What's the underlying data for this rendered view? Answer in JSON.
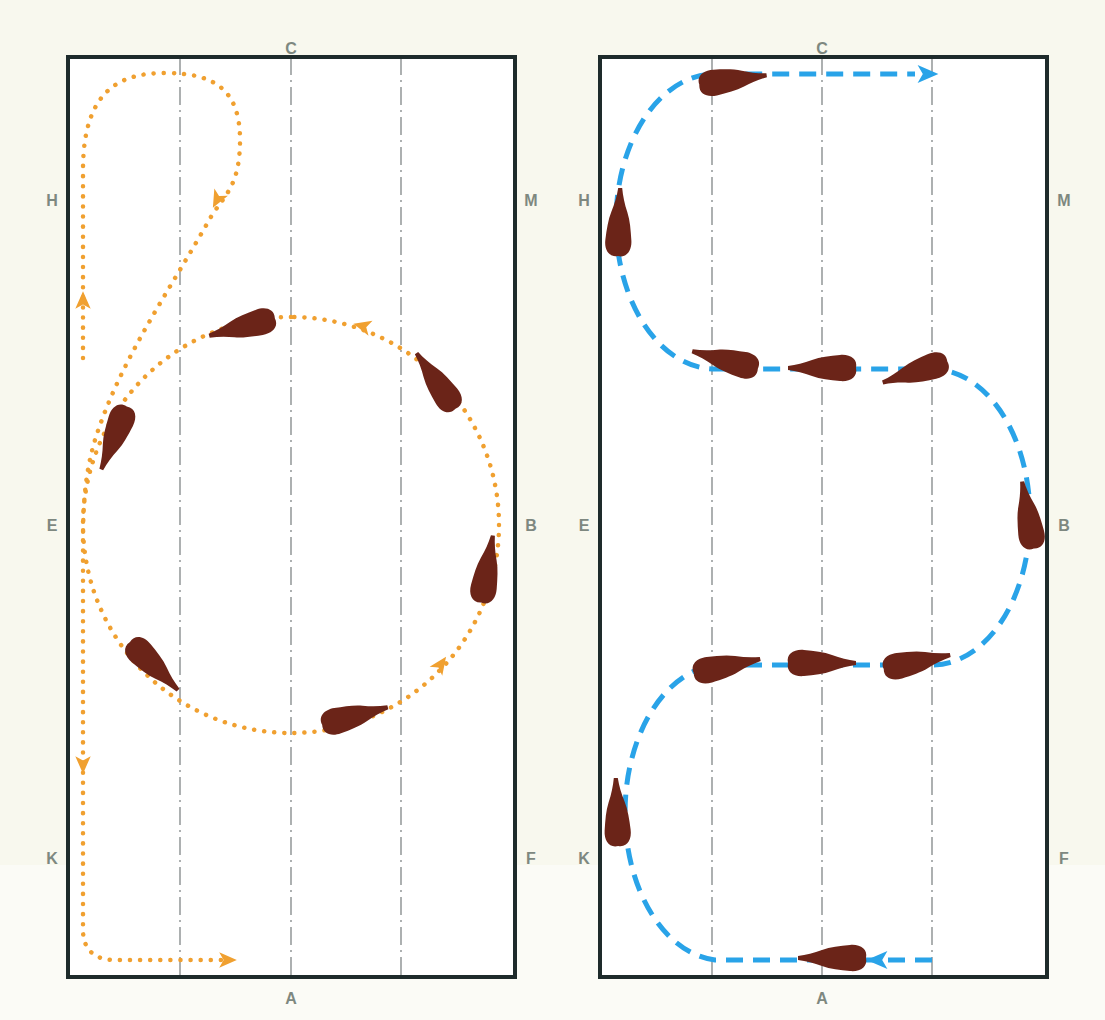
{
  "figure": {
    "colors": {
      "background": "#f8f8ee",
      "arena_fill": "#ffffff",
      "arena_border": "#1e2b2b",
      "centerline": "#8a8f90",
      "letter": "#7e8880",
      "horse": "#6b2418",
      "left_path": "#f0a030",
      "right_path": "#29a3e8"
    }
  },
  "arenas": [
    {
      "id": "left",
      "figure_name": "circle-with-loop",
      "box": {
        "x": 68,
        "y": 57,
        "w": 447,
        "h": 920
      },
      "guide_lines_x": [
        180,
        291,
        401
      ],
      "letters": {
        "top": "C",
        "bottom": "A",
        "left_top": "H",
        "left_mid": "E",
        "left_bottom": "K",
        "right_top": "M",
        "right_mid": "B",
        "right_bottom": "F"
      },
      "letter_positions": {
        "top": [
          291,
          48
        ],
        "bottom": [
          291,
          998
        ],
        "left_top": [
          52,
          200
        ],
        "left_mid": [
          52,
          525
        ],
        "left_bottom": [
          52,
          858
        ],
        "right_top": [
          531,
          200
        ],
        "right_mid": [
          531,
          525
        ],
        "right_bottom": [
          531,
          858
        ]
      },
      "path_style": "dotted",
      "paths": [
        "M 83 358 L 83 170 C 83 90 120 73 165 73 C 215 73 240 90 240 140 C 240 185 225 195 212 215 C 170 290 120 360 95 440 C 86 470 83 500 83 540 L 83 930 C 83 950 95 960 115 960 L 225 960",
        "M 291 317 A 208 208 0 1 0 291 733 A 208 208 0 1 0 291 317"
      ],
      "arrows": [
        {
          "x": 83,
          "y": 300,
          "angle": -90
        },
        {
          "x": 217,
          "y": 200,
          "angle": 118
        },
        {
          "x": 362,
          "y": 326,
          "angle": 195
        },
        {
          "x": 441,
          "y": 664,
          "angle": -55
        },
        {
          "x": 83,
          "y": 765,
          "angle": 90
        },
        {
          "x": 228,
          "y": 960,
          "angle": 0
        }
      ],
      "horses": [
        {
          "x": 242,
          "y": 327,
          "angle": 165
        },
        {
          "x": 436,
          "y": 381,
          "angle": 235
        },
        {
          "x": 487,
          "y": 569,
          "angle": 280
        },
        {
          "x": 355,
          "y": 716,
          "angle": -15
        },
        {
          "x": 154,
          "y": 666,
          "angle": 45
        },
        {
          "x": 114,
          "y": 438,
          "angle": 112
        }
      ]
    },
    {
      "id": "right",
      "figure_name": "three-loop-serpentine",
      "box": {
        "x": 600,
        "y": 57,
        "w": 447,
        "h": 920
      },
      "guide_lines_x": [
        712,
        822,
        932
      ],
      "letters": {
        "top": "C",
        "bottom": "A",
        "left_top": "H",
        "left_mid": "E",
        "left_bottom": "K",
        "right_top": "M",
        "right_mid": "B",
        "right_bottom": "F"
      },
      "letter_positions": {
        "top": [
          822,
          48
        ],
        "bottom": [
          822,
          998
        ],
        "left_top": [
          584,
          200
        ],
        "left_mid": [
          584,
          525
        ],
        "left_bottom": [
          584,
          858
        ],
        "right_top": [
          1064,
          200
        ],
        "right_mid": [
          1064,
          525
        ],
        "right_bottom": [
          1064,
          858
        ]
      },
      "path_style": "dashed",
      "paths": [
        "M 932 960 L 715 960 A 98 148 0 0 1 715 665 L 932 665 A 98 148 0 0 0 932 369 L 715 369 A 98 146 0 0 1 715 74 L 915 74"
      ],
      "arrows": [
        {
          "x": 928,
          "y": 74,
          "angle": 0
        },
        {
          "x": 877,
          "y": 960,
          "angle": 180
        }
      ],
      "horses": [
        {
          "x": 733,
          "y": 80,
          "angle": -8
        },
        {
          "x": 619,
          "y": 222,
          "angle": -88
        },
        {
          "x": 725,
          "y": 360,
          "angle": 195
        },
        {
          "x": 822,
          "y": 368,
          "angle": 180
        },
        {
          "x": 915,
          "y": 372,
          "angle": 162
        },
        {
          "x": 1028,
          "y": 515,
          "angle": -100
        },
        {
          "x": 917,
          "y": 662,
          "angle": -12
        },
        {
          "x": 822,
          "y": 663,
          "angle": 0
        },
        {
          "x": 727,
          "y": 666,
          "angle": -12
        },
        {
          "x": 617,
          "y": 812,
          "angle": -92
        },
        {
          "x": 832,
          "y": 958,
          "angle": 180
        }
      ]
    }
  ]
}
